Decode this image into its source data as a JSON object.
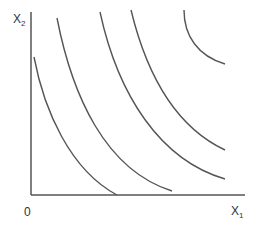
{
  "diagram": {
    "type": "indifference-curve-map",
    "axes": {
      "y_label": {
        "base": "X",
        "subscript": "2"
      },
      "x_label": {
        "base": "X",
        "subscript": "1"
      },
      "origin_label": "0"
    },
    "curves": [
      {
        "id": "curve-1",
        "path": "M34,57 C44,110 70,170 117,195"
      },
      {
        "id": "curve-2",
        "path": "M57,18 C72,95 105,170 172,191"
      },
      {
        "id": "curve-3",
        "path": "M100,12 C118,95 160,160 225,179"
      },
      {
        "id": "curve-4",
        "path": "M131,10 C148,80 178,128 225,150"
      },
      {
        "id": "curve-5",
        "path": "M184,10 C184,36 198,56 225,64"
      }
    ],
    "colors": {
      "line": "#555555",
      "axis": "#555555",
      "background": "#ffffff"
    }
  }
}
